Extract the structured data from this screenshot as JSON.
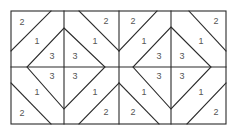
{
  "diagram": {
    "type": "quilt-block-piecing-diagram",
    "blocks": 2,
    "labels": {
      "corner": "2",
      "side": "1",
      "center": "3"
    },
    "regions": [
      {
        "id": "b1-tl-corner",
        "label": "2"
      },
      {
        "id": "b1-tr-corner",
        "label": "2"
      },
      {
        "id": "b1-tl-side",
        "label": "1"
      },
      {
        "id": "b1-tr-side",
        "label": "1"
      },
      {
        "id": "b1-center-tl",
        "label": "3"
      },
      {
        "id": "b1-center-tr",
        "label": "3"
      },
      {
        "id": "b1-center-bl",
        "label": "3"
      },
      {
        "id": "b1-center-br",
        "label": "3"
      },
      {
        "id": "b1-bl-side",
        "label": "1"
      },
      {
        "id": "b1-br-side",
        "label": "1"
      },
      {
        "id": "b1-bl-corner",
        "label": "2"
      },
      {
        "id": "b1-br-corner",
        "label": "2"
      },
      {
        "id": "b2-tl-corner",
        "label": "2"
      },
      {
        "id": "b2-tr-corner",
        "label": "2"
      },
      {
        "id": "b2-tl-side",
        "label": "1"
      },
      {
        "id": "b2-tr-side",
        "label": "1"
      },
      {
        "id": "b2-center-tl",
        "label": "3"
      },
      {
        "id": "b2-center-tr",
        "label": "3"
      },
      {
        "id": "b2-center-bl",
        "label": "3"
      },
      {
        "id": "b2-center-br",
        "label": "3"
      },
      {
        "id": "b2-bl-side",
        "label": "1"
      },
      {
        "id": "b2-br-side",
        "label": "1"
      },
      {
        "id": "b2-bl-corner",
        "label": "2"
      },
      {
        "id": "b2-br-corner",
        "label": "2"
      }
    ]
  }
}
